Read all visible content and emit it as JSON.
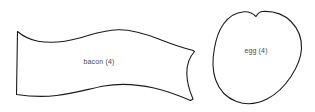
{
  "canvas": {
    "width": 315,
    "height": 112,
    "background_color": "#ffffff"
  },
  "style": {
    "outline_color": "#1a1a1a",
    "fill_color": "#ffffff",
    "label_color": "#4a4a4a",
    "stroke_width": 1.1
  },
  "shapes": [
    {
      "id": "bacon",
      "name": "bacon-shape",
      "label": "bacon (4)",
      "label_x": 99,
      "label_y": 61,
      "description": "wavy-strip",
      "path": "M 17.5 31.5 L 16.5 94.5 C 30 96.5 44 97 56.5 95.5 C 74 93.5 90 88.5 104 86 C 120 83.2 138 84.5 154 88 C 168 91 180 96 190.5 100.5 L 193 99 C 189.5 91 187 82 186.8 73.5 C 186.6 64.5 189.5 57 194.5 51.5 L 192.5 50.2 C 181 47.5 170 43.5 160 39.5 C 146 34 132 29.5 118 29.8 C 104 30.1 92 34.5 79.5 38 C 66 41.8 52 43.5 38 41.2 C 31 40 24 37 17.5 31.5 Z"
    },
    {
      "id": "egg",
      "name": "egg-shape",
      "label": "egg (4)",
      "label_x": 256,
      "label_y": 50,
      "description": "rounded-blob",
      "path": "M 262 11.5 C 274 10.8 284 14.5 291 21.5 C 298.5 29 302 39 301.5 49 C 301 59 296.5 68 291 76.5 C 285 85.5 277 94 267 99 C 257.5 103.8 246 105 236.5 101.5 C 226.5 97.8 219 89.5 215.5 79.5 C 212 69.5 212.5 58.5 214.5 48 C 216 39.5 218.5 31 223.5 24 C 228.5 17 236 12.5 244 11.8 C 249 11.4 253 13.5 256 16.5 C 257.5 14 259.5 11.7 262 11.5 Z"
    }
  ]
}
